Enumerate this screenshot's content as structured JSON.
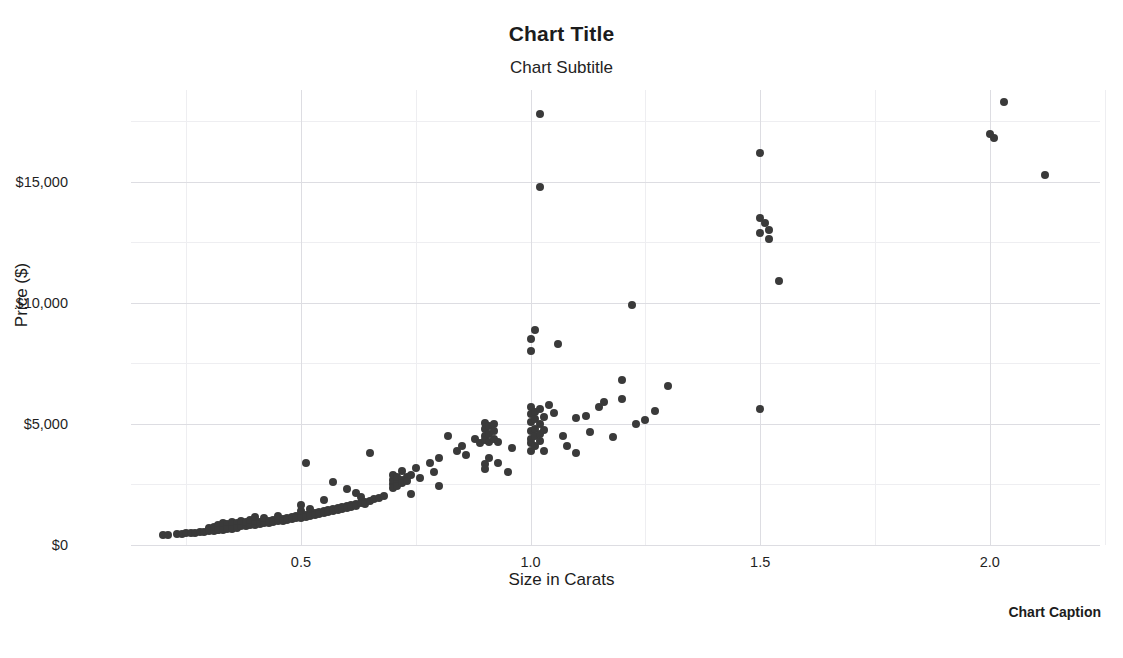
{
  "titles": {
    "title": "Chart Title",
    "subtitle": "Chart Subtitle",
    "caption": "Chart Caption"
  },
  "axes": {
    "x_label": "Size in Carats",
    "y_label": "Price ($)",
    "x_ticks": [
      "0.5",
      "1.0",
      "1.5",
      "2.0"
    ],
    "y_ticks": [
      "$0",
      "$5,000",
      "$10,000",
      "$15,000"
    ]
  },
  "chart_data": {
    "type": "scatter",
    "title": "Chart Title",
    "subtitle": "Chart Subtitle",
    "caption": "Chart Caption",
    "xlabel": "Size in Carats",
    "ylabel": "Price ($)",
    "xlim": [
      0.13,
      2.24
    ],
    "ylim": [
      0,
      18800
    ],
    "x_ticks": [
      0.5,
      1.0,
      1.5,
      2.0
    ],
    "x_tick_labels": [
      "0.5",
      "1.0",
      "1.5",
      "2.0"
    ],
    "y_ticks": [
      0,
      5000,
      10000,
      15000
    ],
    "y_tick_labels": [
      "$0",
      "$5,000",
      "$10,000",
      "$15,000"
    ],
    "x_minor_ticks": [
      0.25,
      0.75,
      1.25,
      1.75,
      2.25
    ],
    "y_minor_ticks": [
      2500,
      7500,
      12500,
      17500
    ],
    "grid": true,
    "legend": false,
    "point_color": "#3a3a3a",
    "point_size": 8,
    "background": "#ffffff",
    "grid_color": "#dddde2",
    "n_points": 214,
    "series": [
      {
        "name": "diamonds",
        "points": [
          [
            0.2,
            400
          ],
          [
            0.21,
            420
          ],
          [
            0.23,
            450
          ],
          [
            0.24,
            470
          ],
          [
            0.25,
            480
          ],
          [
            0.26,
            500
          ],
          [
            0.27,
            510
          ],
          [
            0.28,
            530
          ],
          [
            0.29,
            545
          ],
          [
            0.3,
            560
          ],
          [
            0.3,
            700
          ],
          [
            0.3,
            640
          ],
          [
            0.3,
            610
          ],
          [
            0.31,
            680
          ],
          [
            0.31,
            720
          ],
          [
            0.31,
            590
          ],
          [
            0.31,
            760
          ],
          [
            0.32,
            700
          ],
          [
            0.32,
            640
          ],
          [
            0.32,
            820
          ],
          [
            0.32,
            600
          ],
          [
            0.33,
            730
          ],
          [
            0.33,
            680
          ],
          [
            0.33,
            900
          ],
          [
            0.33,
            620
          ],
          [
            0.34,
            760
          ],
          [
            0.34,
            700
          ],
          [
            0.34,
            850
          ],
          [
            0.34,
            650
          ],
          [
            0.35,
            780
          ],
          [
            0.35,
            720
          ],
          [
            0.35,
            960
          ],
          [
            0.35,
            660
          ],
          [
            0.36,
            800
          ],
          [
            0.36,
            740
          ],
          [
            0.36,
            900
          ],
          [
            0.36,
            690
          ],
          [
            0.37,
            830
          ],
          [
            0.37,
            770
          ],
          [
            0.37,
            1000
          ],
          [
            0.38,
            850
          ],
          [
            0.38,
            790
          ],
          [
            0.38,
            940
          ],
          [
            0.39,
            880
          ],
          [
            0.39,
            810
          ],
          [
            0.39,
            1050
          ],
          [
            0.4,
            900
          ],
          [
            0.4,
            840
          ],
          [
            0.4,
            1000
          ],
          [
            0.4,
            1150
          ],
          [
            0.41,
            930
          ],
          [
            0.41,
            870
          ],
          [
            0.42,
            960
          ],
          [
            0.42,
            900
          ],
          [
            0.42,
            1100
          ],
          [
            0.43,
            990
          ],
          [
            0.43,
            920
          ],
          [
            0.44,
            1020
          ],
          [
            0.44,
            950
          ],
          [
            0.45,
            1050
          ],
          [
            0.45,
            980
          ],
          [
            0.45,
            1200
          ],
          [
            0.46,
            1080
          ],
          [
            0.46,
            1010
          ],
          [
            0.47,
            1110
          ],
          [
            0.47,
            1040
          ],
          [
            0.48,
            1140
          ],
          [
            0.48,
            1070
          ],
          [
            0.49,
            1180
          ],
          [
            0.49,
            1100
          ],
          [
            0.5,
            1220
          ],
          [
            0.5,
            1130
          ],
          [
            0.5,
            1400
          ],
          [
            0.5,
            1650
          ],
          [
            0.51,
            1250
          ],
          [
            0.51,
            1160
          ],
          [
            0.51,
            3400
          ],
          [
            0.52,
            1300
          ],
          [
            0.52,
            1200
          ],
          [
            0.52,
            1500
          ],
          [
            0.53,
            1340
          ],
          [
            0.53,
            1240
          ],
          [
            0.54,
            1380
          ],
          [
            0.54,
            1280
          ],
          [
            0.55,
            1420
          ],
          [
            0.55,
            1320
          ],
          [
            0.55,
            1850
          ],
          [
            0.56,
            1460
          ],
          [
            0.56,
            1360
          ],
          [
            0.57,
            1500
          ],
          [
            0.57,
            1400
          ],
          [
            0.57,
            2600
          ],
          [
            0.58,
            1540
          ],
          [
            0.58,
            1440
          ],
          [
            0.59,
            1580
          ],
          [
            0.59,
            1480
          ],
          [
            0.6,
            1620
          ],
          [
            0.6,
            1520
          ],
          [
            0.6,
            2300
          ],
          [
            0.61,
            1660
          ],
          [
            0.61,
            1560
          ],
          [
            0.62,
            1700
          ],
          [
            0.62,
            1600
          ],
          [
            0.62,
            2150
          ],
          [
            0.63,
            1740
          ],
          [
            0.63,
            2000
          ],
          [
            0.64,
            1780
          ],
          [
            0.64,
            1680
          ],
          [
            0.65,
            1820
          ],
          [
            0.65,
            3800
          ],
          [
            0.66,
            1900
          ],
          [
            0.67,
            1960
          ],
          [
            0.68,
            2020
          ],
          [
            0.7,
            2500
          ],
          [
            0.7,
            2700
          ],
          [
            0.7,
            2900
          ],
          [
            0.7,
            2350
          ],
          [
            0.71,
            2600
          ],
          [
            0.71,
            2800
          ],
          [
            0.71,
            2450
          ],
          [
            0.72,
            2700
          ],
          [
            0.72,
            2550
          ],
          [
            0.72,
            3050
          ],
          [
            0.73,
            2800
          ],
          [
            0.73,
            2650
          ],
          [
            0.74,
            2900
          ],
          [
            0.74,
            2100
          ],
          [
            0.75,
            3200
          ],
          [
            0.76,
            2750
          ],
          [
            0.78,
            3400
          ],
          [
            0.79,
            3000
          ],
          [
            0.8,
            3600
          ],
          [
            0.8,
            2450
          ],
          [
            0.82,
            4500
          ],
          [
            0.84,
            3900
          ],
          [
            0.85,
            4100
          ],
          [
            0.86,
            3700
          ],
          [
            0.88,
            4400
          ],
          [
            0.89,
            4200
          ],
          [
            0.9,
            4500
          ],
          [
            0.9,
            4800
          ],
          [
            0.9,
            5050
          ],
          [
            0.9,
            4350
          ],
          [
            0.9,
            3350
          ],
          [
            0.9,
            3150
          ],
          [
            0.91,
            4600
          ],
          [
            0.91,
            4900
          ],
          [
            0.91,
            4250
          ],
          [
            0.91,
            3600
          ],
          [
            0.92,
            4700
          ],
          [
            0.92,
            5000
          ],
          [
            0.92,
            4400
          ],
          [
            0.93,
            4250
          ],
          [
            0.93,
            3400
          ],
          [
            0.95,
            3000
          ],
          [
            0.96,
            4000
          ],
          [
            1.0,
            4400
          ],
          [
            1.0,
            4700
          ],
          [
            1.0,
            5100
          ],
          [
            1.0,
            5400
          ],
          [
            1.0,
            5700
          ],
          [
            1.0,
            4200
          ],
          [
            1.0,
            3900
          ],
          [
            1.0,
            8000
          ],
          [
            1.0,
            8500
          ],
          [
            1.01,
            4500
          ],
          [
            1.01,
            4800
          ],
          [
            1.01,
            5200
          ],
          [
            1.01,
            5500
          ],
          [
            1.01,
            4100
          ],
          [
            1.01,
            8900
          ],
          [
            1.02,
            4600
          ],
          [
            1.02,
            5000
          ],
          [
            1.02,
            5600
          ],
          [
            1.02,
            4300
          ],
          [
            1.02,
            17800
          ],
          [
            1.02,
            14800
          ],
          [
            1.03,
            4750
          ],
          [
            1.03,
            5300
          ],
          [
            1.03,
            3900
          ],
          [
            1.04,
            5800
          ],
          [
            1.05,
            5450
          ],
          [
            1.06,
            8300
          ],
          [
            1.07,
            4500
          ],
          [
            1.08,
            4100
          ],
          [
            1.1,
            5250
          ],
          [
            1.1,
            3800
          ],
          [
            1.12,
            5350
          ],
          [
            1.13,
            4650
          ],
          [
            1.15,
            5700
          ],
          [
            1.16,
            5900
          ],
          [
            1.18,
            4450
          ],
          [
            1.2,
            6050
          ],
          [
            1.2,
            6800
          ],
          [
            1.22,
            9900
          ],
          [
            1.23,
            5000
          ],
          [
            1.25,
            5150
          ],
          [
            1.27,
            5550
          ],
          [
            1.3,
            6550
          ],
          [
            1.5,
            16200
          ],
          [
            1.5,
            13500
          ],
          [
            1.5,
            12900
          ],
          [
            1.5,
            5600
          ],
          [
            1.51,
            13300
          ],
          [
            1.52,
            13000
          ],
          [
            1.52,
            12650
          ],
          [
            1.54,
            10900
          ],
          [
            2.0,
            17000
          ],
          [
            2.01,
            16800
          ],
          [
            2.03,
            18300
          ],
          [
            2.12,
            15300
          ]
        ]
      }
    ]
  }
}
